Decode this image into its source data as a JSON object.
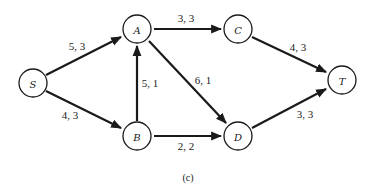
{
  "figure": {
    "caption": "(c)",
    "nodes": [
      {
        "id": "S",
        "label": "S"
      },
      {
        "id": "A",
        "label": "A"
      },
      {
        "id": "B",
        "label": "B"
      },
      {
        "id": "C",
        "label": "C"
      },
      {
        "id": "D",
        "label": "D"
      },
      {
        "id": "T",
        "label": "T"
      }
    ],
    "edges": [
      {
        "from": "S",
        "to": "A",
        "label": "5, 3"
      },
      {
        "from": "S",
        "to": "B",
        "label": "4, 3"
      },
      {
        "from": "B",
        "to": "A",
        "label": "5, 1"
      },
      {
        "from": "A",
        "to": "C",
        "label": "3, 3"
      },
      {
        "from": "A",
        "to": "D",
        "label": "6, 1"
      },
      {
        "from": "B",
        "to": "D",
        "label": "2, 2"
      },
      {
        "from": "C",
        "to": "T",
        "label": "4, 3"
      },
      {
        "from": "D",
        "to": "T",
        "label": "3, 3"
      }
    ]
  }
}
